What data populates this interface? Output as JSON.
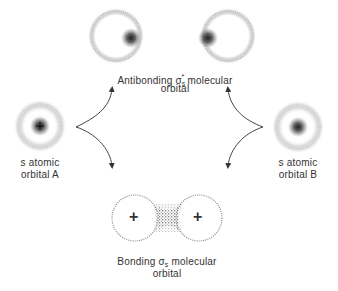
{
  "diagram": {
    "type": "molecular-orbital-formation",
    "colors": {
      "ink": "#333333",
      "arrow": "#444444",
      "background": "#ffffff"
    },
    "atomic_orbitals": [
      {
        "id": "A",
        "line1": "s atomic",
        "line2": "orbital A"
      },
      {
        "id": "B",
        "line1": "s atomic",
        "line2": "orbital B"
      }
    ],
    "antibonding": {
      "prefix": "Antibonding ",
      "symbol": "σ",
      "subscript": "s",
      "superscript": "*",
      "suffix": " molecular",
      "line2": "orbital"
    },
    "bonding": {
      "prefix": "Bonding ",
      "symbol": "σ",
      "subscript": "s",
      "suffix": " molecular",
      "line2": "orbital",
      "nucleus_signs": [
        "+",
        "+"
      ]
    }
  }
}
